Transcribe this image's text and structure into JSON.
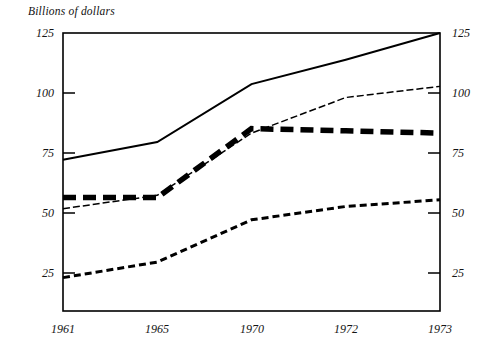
{
  "chart_data": {
    "type": "line",
    "title": "Billions of dollars",
    "xlabel": "",
    "ylabel": "",
    "categories": [
      "1961",
      "1965",
      "1970",
      "1972",
      "1973"
    ],
    "x": [
      1961,
      1965,
      1970,
      1972,
      1973
    ],
    "ylim": [
      0,
      125
    ],
    "yticks": [
      25,
      50,
      75,
      100,
      125
    ],
    "ytick_labels": [
      "25",
      "50",
      "75",
      "100",
      "125"
    ],
    "right_axis_yticks": [
      25,
      50,
      75,
      100,
      125
    ],
    "right_axis_ytick_labels": [
      "25",
      "50",
      "75",
      "100",
      "125"
    ],
    "xtick_labels": [
      "1961",
      "1965",
      "1970",
      "1972",
      "1973"
    ],
    "grid": false,
    "legend": "none",
    "axis_spacing": "categorical-equal",
    "series": [
      {
        "name": "series-solid",
        "style": "solid",
        "values": [
          68,
          76,
          102,
          113,
          125
        ]
      },
      {
        "name": "series-thin-dashed",
        "style": "thin-dashed",
        "values": [
          46,
          52,
          80,
          96,
          101
        ]
      },
      {
        "name": "series-thick-dashed",
        "style": "thick-dashed",
        "values": [
          51,
          51,
          82,
          81,
          80
        ]
      },
      {
        "name": "series-fine-dotted",
        "style": "fine-dotted",
        "values": [
          15,
          22,
          41,
          47,
          50
        ]
      }
    ],
    "colors": {
      "axis": "#000000",
      "series_solid": "#000000",
      "series_thin_dashed": "#000000",
      "series_thick_dashed": "#000000",
      "series_fine_dotted": "#000000",
      "background": "#ffffff"
    }
  },
  "axes": {
    "left_labels": [
      "125",
      "100",
      "75",
      "50",
      "25"
    ],
    "right_labels": [
      "125",
      "100",
      "75",
      "50",
      "25"
    ],
    "x_labels": [
      "1961",
      "1965",
      "1970",
      "1972",
      "1973"
    ]
  },
  "title": "Billions of dollars"
}
